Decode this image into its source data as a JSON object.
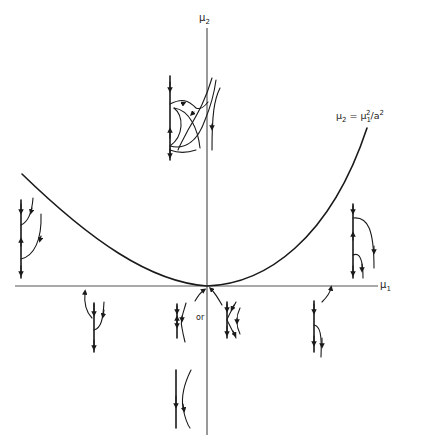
{
  "diagram": {
    "type": "bifurcation-diagram",
    "axes": {
      "horizontal_label": "μ",
      "horizontal_subscript": "1",
      "vertical_label": "μ",
      "vertical_subscript": "2"
    },
    "curve": {
      "equation_lhs": "μ",
      "equation_lhs_sub": "2",
      "equation_eq": " = μ",
      "equation_rhs_sub": "1",
      "equation_rhs_sup": "2",
      "equation_tail": "/a",
      "equation_tail_sup": "2",
      "shape": "parabola"
    },
    "annotations": {
      "or_label": "or"
    },
    "phase_portraits": [
      {
        "id": "upper-center",
        "region": "above parabola, on μ2 axis",
        "description": "saddle-node with homoclinic loops"
      },
      {
        "id": "left-upper",
        "region": "left of parabola, μ1<0, μ2>0",
        "description": "invariant line with two fixed points"
      },
      {
        "id": "right-upper",
        "region": "right of parabola, μ1>0, μ2>0",
        "description": "invariant line with two fixed points"
      },
      {
        "id": "lower-left",
        "region": "below μ1 axis, μ1<0",
        "description": "single fixed point on line"
      },
      {
        "id": "origin-a",
        "region": "origin",
        "description": "degenerate flow option 1"
      },
      {
        "id": "origin-b",
        "region": "origin",
        "description": "degenerate flow option 2"
      },
      {
        "id": "lower-right",
        "region": "below μ1 axis, μ1>0",
        "description": "single fixed point on line"
      },
      {
        "id": "lower-center",
        "region": "negative μ2 axis",
        "description": "flow with no fixed points"
      }
    ]
  }
}
